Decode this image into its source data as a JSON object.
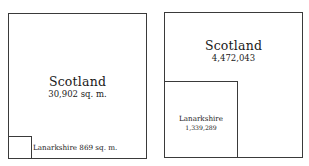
{
  "diagrams": [
    {
      "name": "area",
      "outer": {
        "title": "Scotland",
        "value": "30,902 sq. m."
      },
      "inner": {
        "title": "Lanarkshire",
        "value": "869 sq. m.",
        "label": "Lanarkshire 869 sq. m."
      }
    },
    {
      "name": "population",
      "outer": {
        "title": "Scotland",
        "value": "4,472,043"
      },
      "inner": {
        "title": "Lanarkshire",
        "value": "1,339,289"
      }
    }
  ],
  "colors": {
    "line": "#3a3a3a",
    "text": "#1a1a1a",
    "background": "#ffffff"
  }
}
